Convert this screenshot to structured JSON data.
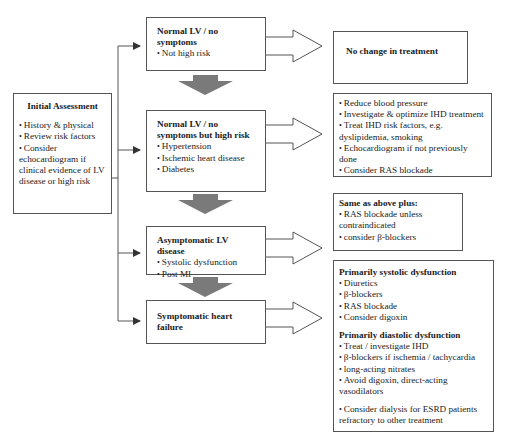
{
  "initial": {
    "title": "Initial Assessment",
    "items": [
      "History  & physical",
      "Review risk factors",
      "Consider echocardiogram if clinical evidence of LV disease or high risk"
    ]
  },
  "stages": [
    {
      "title": "Normal LV / no symptoms",
      "items": [
        "Not high risk"
      ]
    },
    {
      "title": "Normal LV / no symptoms but high risk",
      "items": [
        "Hypertension",
        "Ischemic heart disease",
        "Diabetes"
      ]
    },
    {
      "title": "Asymptomatic LV disease",
      "items": [
        "Systolic dysfunction",
        "Post MI"
      ]
    },
    {
      "title": "Symptomatic heart failure",
      "items": []
    }
  ],
  "treatments": [
    {
      "title": "No change in treatment"
    },
    {
      "items": [
        "Reduce blood pressure",
        "Investigate & optimize IHD treatment",
        "Treat IHD risk factors, e.g. dyslipidemia, smoking",
        "Echocardiogram if not previously done",
        "Consider RAS blockade"
      ]
    },
    {
      "title": "Same as above plus:",
      "items": [
        "RAS blockade unless contraindicated",
        "consider β-blockers"
      ]
    },
    {
      "sections": [
        {
          "title": "Primarily systolic dysfunction",
          "items": [
            "Diuretics",
            "β-blockers",
            "RAS blockade",
            "Consider digoxin"
          ]
        },
        {
          "title": "Primarily diastolic dysfunction",
          "items": [
            "Treat / investigate IHD",
            "β-blockers if ischemia / tachycardia",
            "long-acting nitrates",
            "Avoid digoxin, direct-acting vasodilators"
          ]
        },
        {
          "title": "",
          "items": [
            "Consider dialysis for ESRD patients refractory to other treatment"
          ]
        }
      ]
    }
  ],
  "colors": {
    "line": "#555555",
    "down_arrow": "#7a7a7a"
  }
}
